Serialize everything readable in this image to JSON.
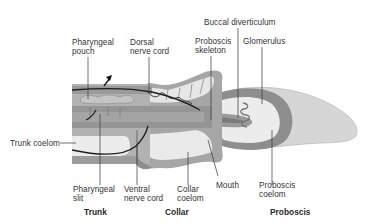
{
  "figure": {
    "colors": {
      "background": "#ffffff",
      "body_dark": "#8a8a8a",
      "body_mid": "#a8a8a8",
      "body_light": "#c8c8c8",
      "coelom": "#ebebeb",
      "line": "#222222",
      "text": "#333333"
    }
  },
  "labels": {
    "pharyngeal_pouch": "Pharyngeal\npouch",
    "dorsal_nerve_cord": "Dorsal\nnerve cord",
    "buccal_diverticulum": "Buccal diverticulum",
    "proboscis_skeleton": "Proboscis\nskeleton",
    "glomerulus": "Glomerulus",
    "trunk_coelom": "Trunk coelom",
    "pharyngeal_slit": "Pharyngeal\nslit",
    "ventral_nerve_cord": "Ventral\nnerve cord",
    "collar_coelom": "Collar\ncoelom",
    "mouth": "Mouth",
    "proboscis_coelom": "Proboscis\ncoelom"
  },
  "regions": {
    "trunk": "Trunk",
    "collar": "Collar",
    "proboscis": "Proboscis"
  }
}
